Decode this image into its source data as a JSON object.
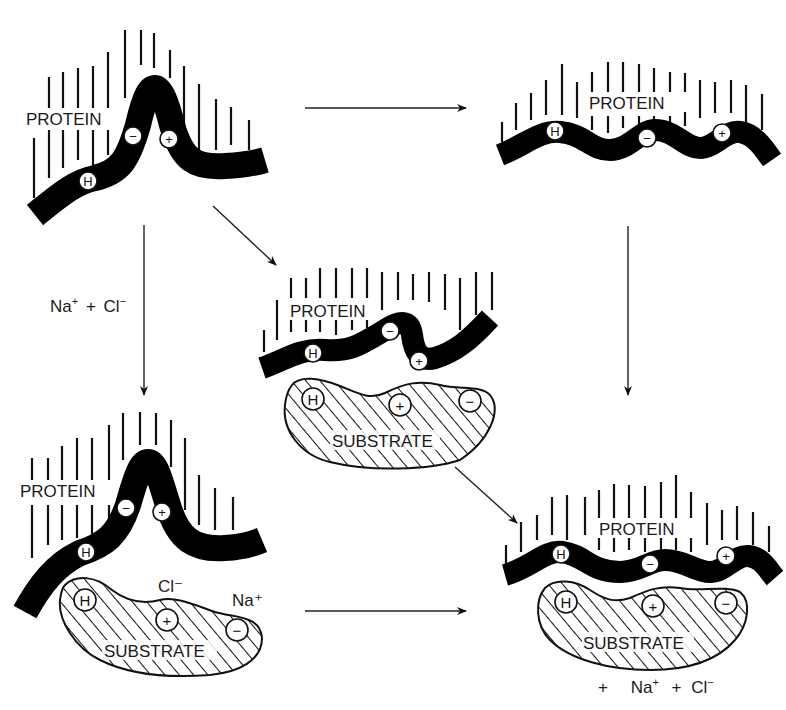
{
  "diagram": {
    "type": "protein-substrate binding with salt ions",
    "panels": {
      "top_left": {
        "label": "PROTEIN",
        "state": "folded, peaked conformation",
        "charges": [
          "H",
          "−",
          "+"
        ]
      },
      "top_right": {
        "label": "PROTEIN",
        "state": "wavy conformation",
        "charges": [
          "H",
          "−",
          "+"
        ]
      },
      "middle": {
        "protein_label": "PROTEIN",
        "substrate_label": "SUBSTRATE",
        "protein_charges": [
          "H",
          "−",
          "+"
        ],
        "substrate_charges": [
          "H",
          "+",
          "−"
        ]
      },
      "bottom_left": {
        "protein_label": "PROTEIN",
        "substrate_label": "SUBSTRATE",
        "protein_charges": [
          "H",
          "−",
          "+"
        ],
        "substrate_charges": [
          "H",
          "+",
          "−"
        ],
        "ion_cl": "Cl⁻",
        "ion_na": "Na⁺"
      },
      "bottom_right": {
        "protein_label": "PROTEIN",
        "substrate_label": "SUBSTRATE",
        "protein_charges": [
          "H",
          "−",
          "+"
        ],
        "substrate_charges": [
          "H",
          "+",
          "−"
        ],
        "released": {
          "plus1": "+",
          "na": "Na",
          "na_sup": "+",
          "plus2": "+",
          "cl": "Cl",
          "cl_sup": "−"
        }
      }
    },
    "arrow_labels": {
      "left_down": {
        "na": "Na",
        "na_sup": "+",
        "plus": "+",
        "cl": "Cl",
        "cl_sup": "−"
      }
    },
    "symbols": {
      "hydrophobic": "H",
      "minus": "−",
      "plus": "+"
    }
  }
}
